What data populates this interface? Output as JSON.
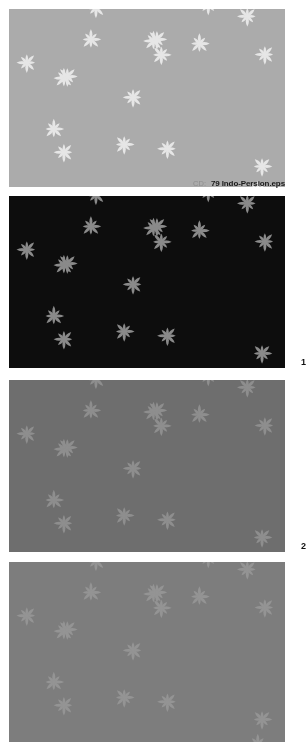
{
  "sheet": {
    "width": 306,
    "height": 742,
    "background": "#ffffff",
    "kind": "pattern-swatch-sheet"
  },
  "caption": {
    "prefix": "CD:",
    "filename": "79 Indo-Persion.eps",
    "prefix_color": "#8d8d8d",
    "filename_color": "#1a1a1a"
  },
  "panels": [
    {
      "id": "panel-0",
      "number_label": "",
      "x": 9,
      "y": 9,
      "width": 276,
      "height": 178,
      "background": "#ababab",
      "flower_color": "#e6e6e6",
      "rosette_ring_color": "#111111",
      "rosette_center_color": "#f2f2f2",
      "dot_color": "#111111",
      "motif_pitch": 22.4,
      "description": "light grey ground, white eight-petal stars, black dotted rosettes"
    },
    {
      "id": "panel-1",
      "number_label": "1",
      "x": 9,
      "y": 196,
      "width": 276,
      "height": 172,
      "background": "#0d0d0d",
      "flower_color": "#8a8a8a",
      "rosette_ring_color": "#8a8a8a",
      "rosette_center_color": "#ffffff",
      "dot_color": "#8a8a8a",
      "motif_pitch": 22.4,
      "description": "black ground, grey eight-petal stars, grey rosettes with white centres"
    },
    {
      "id": "panel-2",
      "number_label": "2",
      "x": 9,
      "y": 380,
      "width": 276,
      "height": 172,
      "background": "#6e6e6e",
      "flower_color": "#8e8e8e",
      "rosette_ring_color": "#f4f4f4",
      "rosette_center_color": "#0d0d0d",
      "dot_color": "#f4f4f4",
      "motif_pitch": 22.4,
      "description": "mid grey ground, lighter grey stars, white dotted rosettes with black centres"
    },
    {
      "id": "panel-3",
      "number_label": "",
      "x": 9,
      "y": 562,
      "width": 276,
      "height": 180,
      "background": "#7d7d7d",
      "flower_color": "#949494",
      "rosette_ring_color": "#f6f6f6",
      "rosette_center_color": "#8a8a8a",
      "dot_color": "#f6f6f6",
      "motif_pitch": 22.4,
      "description": "grey ground, faint grey stars, white dotted rosettes, cropped at page bottom"
    }
  ]
}
